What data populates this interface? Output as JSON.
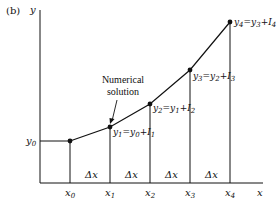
{
  "panel_label": "(b)",
  "axes": {
    "y_label": "y",
    "x_label": "x"
  },
  "y0_label": "y",
  "y0_sub": "0",
  "x_ticks": [
    {
      "base": "x",
      "sub": "0"
    },
    {
      "base": "x",
      "sub": "1"
    },
    {
      "base": "x",
      "sub": "2"
    },
    {
      "base": "x",
      "sub": "3"
    },
    {
      "base": "x",
      "sub": "4"
    }
  ],
  "intervals": [
    "Δx",
    "Δx",
    "Δx",
    "Δx"
  ],
  "annotation": {
    "line1": "Numerical",
    "line2": "solution"
  },
  "point_labels": [
    {
      "lhs": "y",
      "lhs_sub": "1",
      "eq": "=",
      "r1": "y",
      "r1_sub": "0",
      "plus": "+",
      "r2": "I",
      "r2_sub": "1"
    },
    {
      "lhs": "y",
      "lhs_sub": "2",
      "eq": "=",
      "r1": "y",
      "r1_sub": "1",
      "plus": "+",
      "r2": "I",
      "r2_sub": "2"
    },
    {
      "lhs": "y",
      "lhs_sub": "3",
      "eq": "=",
      "r1": "y",
      "r1_sub": "2",
      "plus": "+",
      "r2": "I",
      "r2_sub": "3"
    },
    {
      "lhs": "y",
      "lhs_sub": "4",
      "eq": "=",
      "r1": "y",
      "r1_sub": "3",
      "plus": "+",
      "r2": "I",
      "r2_sub": "4"
    }
  ],
  "colors": {
    "line": "#111111",
    "background": "#ffffff"
  }
}
